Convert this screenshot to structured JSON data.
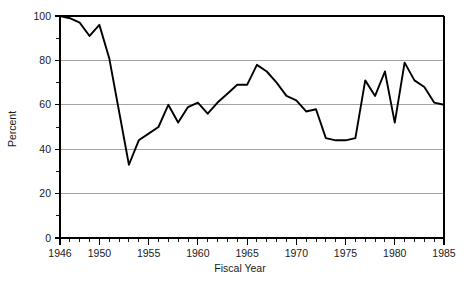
{
  "chart_data": {
    "type": "line",
    "title": "",
    "xlabel": "Fiscal Year",
    "ylabel": "Percent",
    "xlim": [
      1946,
      1985
    ],
    "ylim": [
      0,
      100
    ],
    "grid": true,
    "legend": "none",
    "y_ticks": [
      0,
      20,
      40,
      60,
      80,
      100
    ],
    "y_tick_labels": [
      "0",
      "20",
      "40",
      "60",
      "80",
      "100"
    ],
    "y_minor_ticks": [
      10,
      30,
      50,
      70,
      90
    ],
    "x_tick_labels": [
      "1946",
      "1950",
      "1955",
      "1960",
      "1965",
      "1970",
      "1975",
      "1980",
      "1985"
    ],
    "x_tick_values": [
      1946,
      1950,
      1955,
      1960,
      1965,
      1970,
      1975,
      1980,
      1985
    ],
    "x_minor_tick_step": 1,
    "series": [
      {
        "name": "Percent",
        "color": "#000000",
        "x": [
          1946,
          1947,
          1948,
          1949,
          1950,
          1951,
          1952,
          1953,
          1954,
          1955,
          1956,
          1957,
          1958,
          1959,
          1960,
          1961,
          1962,
          1963,
          1964,
          1965,
          1966,
          1967,
          1968,
          1969,
          1970,
          1971,
          1972,
          1973,
          1974,
          1975,
          1976,
          1977,
          1978,
          1979,
          1980,
          1981,
          1982,
          1983,
          1984,
          1985
        ],
        "values": [
          100,
          99,
          97,
          91,
          96,
          81,
          57,
          33,
          44,
          47,
          50,
          60,
          52,
          59,
          61,
          56,
          61,
          65,
          69,
          69,
          78,
          75,
          70,
          64,
          62,
          57,
          58,
          45,
          44,
          44,
          45,
          71,
          64,
          75,
          52,
          79,
          71,
          68,
          61,
          60
        ]
      }
    ]
  }
}
